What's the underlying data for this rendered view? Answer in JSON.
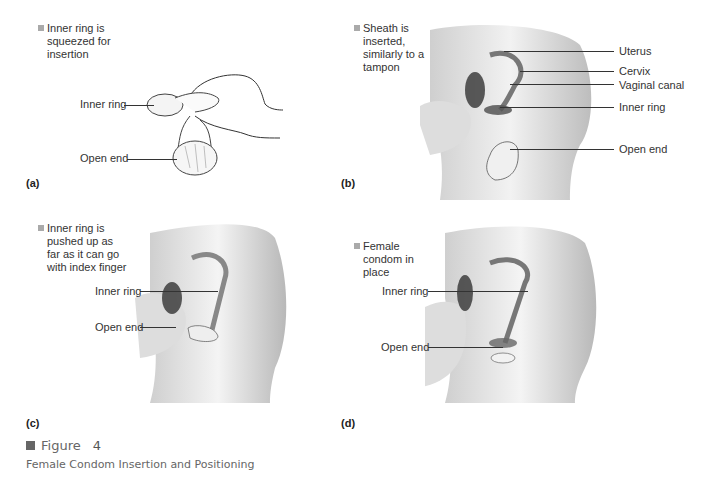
{
  "panels": [
    {
      "id": "a",
      "panel_label": "(a)",
      "step_text": "Inner ring is\nsqueezed for\ninsertion",
      "labels": [
        "Inner ring",
        "Open end"
      ]
    },
    {
      "id": "b",
      "panel_label": "(b)",
      "step_text": "Sheath is\ninserted,\nsimilarly to a\ntampon",
      "labels": [
        "Uterus",
        "Cervix",
        "Vaginal canal",
        "Inner ring",
        "Open end"
      ]
    },
    {
      "id": "c",
      "panel_label": "(c)",
      "step_text": "Inner ring is\npushed up as\nfar as it can go\nwith index finger",
      "labels": [
        "Inner ring",
        "Open end"
      ]
    },
    {
      "id": "d",
      "panel_label": "(d)",
      "step_text": "Female\ncondom in\nplace",
      "labels": [
        "Inner ring",
        "Open end"
      ]
    }
  ],
  "figure": {
    "word": "Figure",
    "number": "4",
    "caption": "Female Condom Insertion and Positioning"
  }
}
